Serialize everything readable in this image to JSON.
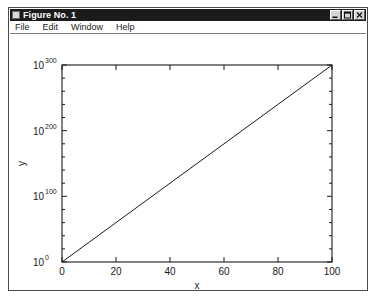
{
  "window": {
    "title": "Figure No. 1",
    "system_menu_icon": "window-menu-icon",
    "buttons": [
      {
        "name": "minimize",
        "glyph": "minimize-icon"
      },
      {
        "name": "maximize",
        "glyph": "maximize-icon"
      },
      {
        "name": "close",
        "glyph": "close-icon"
      }
    ]
  },
  "menu_bar": {
    "items": [
      {
        "label": "File"
      },
      {
        "label": "Edit"
      },
      {
        "label": "Window"
      },
      {
        "label": "Help"
      }
    ]
  },
  "chart_data": {
    "type": "line",
    "title": "",
    "xlabel": "x",
    "ylabel": "y",
    "xscale": "linear",
    "yscale": "log",
    "xlim": [
      0,
      100
    ],
    "ylim": [
      1,
      1e+300
    ],
    "grid": false,
    "legend": null,
    "box": true,
    "tick_direction": "in",
    "x_ticks": [
      {
        "value": 0,
        "label": "0"
      },
      {
        "value": 20,
        "label": "20"
      },
      {
        "value": 40,
        "label": "40"
      },
      {
        "value": 60,
        "label": "60"
      },
      {
        "value": 80,
        "label": "80"
      },
      {
        "value": 100,
        "label": "100"
      }
    ],
    "y_ticks": [
      {
        "exponent": 0,
        "base": "10",
        "label": "0"
      },
      {
        "exponent": 100,
        "base": "10",
        "label": "100"
      },
      {
        "exponent": 200,
        "base": "10",
        "label": "200"
      },
      {
        "exponent": 300,
        "base": "10",
        "label": "300"
      }
    ],
    "y_minor_tick_exponents": [
      20,
      40,
      60,
      80,
      120,
      140,
      160,
      180,
      220,
      240,
      260,
      280
    ],
    "series": [
      {
        "name": "y = 10^(3x)",
        "color": "#1a1a1a",
        "linewidth": 1,
        "x": [
          0,
          10,
          20,
          30,
          40,
          50,
          60,
          70,
          80,
          90,
          100
        ],
        "y_exponent": [
          0,
          30,
          60,
          90,
          120,
          150,
          180,
          210,
          240,
          270,
          300
        ]
      }
    ]
  }
}
